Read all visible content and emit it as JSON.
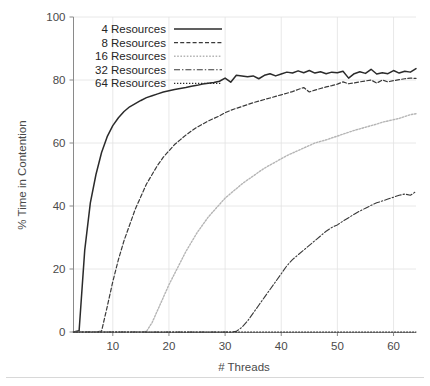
{
  "chart_data": {
    "type": "line",
    "title": "",
    "xlabel": "# Threads",
    "ylabel": "% Time in Contention",
    "xlim": [
      3,
      64
    ],
    "ylim": [
      0,
      100
    ],
    "xticks": [
      10,
      20,
      30,
      40,
      50,
      60
    ],
    "yticks": [
      0,
      20,
      40,
      60,
      80,
      100
    ],
    "xtick_labels": [
      "10",
      "20",
      "30",
      "40",
      "50",
      "60"
    ],
    "ytick_labels": [
      "0",
      "20",
      "40",
      "60",
      "80",
      "100"
    ],
    "grid": true,
    "legend_position": "upper left",
    "x": [
      3,
      4,
      5,
      6,
      7,
      8,
      9,
      10,
      11,
      12,
      13,
      14,
      15,
      16,
      17,
      18,
      19,
      20,
      21,
      22,
      23,
      24,
      25,
      26,
      27,
      28,
      29,
      30,
      31,
      32,
      33,
      34,
      35,
      36,
      37,
      38,
      39,
      40,
      41,
      42,
      43,
      44,
      45,
      46,
      47,
      48,
      49,
      50,
      51,
      52,
      53,
      54,
      55,
      56,
      57,
      58,
      59,
      60,
      61,
      62,
      63,
      64
    ],
    "series": [
      {
        "name": "4 Resources",
        "label": "4 Resources",
        "linestyle": "solid",
        "color": "#2b2b2b",
        "dasharray": "",
        "width": 1.5,
        "values": [
          0,
          0.4,
          26,
          41,
          50,
          57,
          62,
          65.5,
          68,
          70,
          71.5,
          72.5,
          73.5,
          74.4,
          75,
          75.6,
          76.2,
          76.6,
          77,
          77.3,
          77.6,
          78,
          78.3,
          78.7,
          79,
          79.2,
          79.6,
          80.6,
          79.3,
          81.5,
          81.3,
          81,
          81.3,
          80.4,
          81.5,
          82,
          81.3,
          81.9,
          82.5,
          82.2,
          82.9,
          82.3,
          83,
          82.2,
          82.6,
          82,
          82.5,
          82.3,
          82.8,
          80.6,
          82,
          82.6,
          82.1,
          83.4,
          81.9,
          82.3,
          82,
          83,
          82.2,
          82.8,
          82.5,
          83.6
        ]
      },
      {
        "name": "8 Resources",
        "label": "8 Resources",
        "linestyle": "dashed",
        "color": "#3a3a3a",
        "dasharray": "4,2.2",
        "width": 1.2,
        "values": [
          0,
          0,
          0,
          0,
          0,
          0.3,
          8,
          16,
          23,
          29,
          34,
          39,
          43,
          47,
          50,
          53,
          55.5,
          57.5,
          59.5,
          61,
          62.5,
          63.8,
          65,
          66,
          67,
          67.8,
          68.6,
          69.6,
          70.4,
          71,
          71.6,
          72.2,
          72.8,
          73.3,
          73.8,
          74.3,
          74.8,
          75.3,
          75.8,
          76.3,
          77,
          77.6,
          76.2,
          76.8,
          77.3,
          77.8,
          78.2,
          78.7,
          79.4,
          78.8,
          79.1,
          79.4,
          79.7,
          80,
          79,
          80,
          79.4,
          79.8,
          80.1,
          80.4,
          80.6,
          80.5
        ]
      },
      {
        "name": "16 Resources",
        "label": "16 Resources",
        "linestyle": "dotted",
        "color": "#b5b5b5",
        "dasharray": "1.6,1.6",
        "width": 1.4,
        "values": [
          0,
          0,
          0,
          0,
          0,
          0,
          0,
          0,
          0,
          0,
          0,
          0,
          0,
          0.2,
          3,
          7,
          11,
          15,
          18.5,
          22,
          25.5,
          28.5,
          31.5,
          34,
          36.5,
          38.5,
          40.5,
          42.5,
          44,
          45.5,
          47,
          48.3,
          49.5,
          50.8,
          52,
          53,
          54,
          55,
          56,
          56.8,
          57.6,
          58.4,
          59.2,
          60,
          60.5,
          61,
          61.6,
          62.2,
          62.8,
          63.4,
          64,
          64.5,
          65,
          65.5,
          66,
          66.6,
          67,
          67.4,
          67.8,
          68.4,
          69,
          69.3
        ]
      },
      {
        "name": "32 Resources",
        "label": "32 Resources",
        "linestyle": "dashdot",
        "color": "#3a3a3a",
        "dasharray": "6,2,1.4,2",
        "width": 1.1,
        "values": [
          0,
          0,
          0,
          0,
          0,
          0,
          0,
          0,
          0,
          0,
          0,
          0,
          0,
          0,
          0,
          0,
          0,
          0,
          0,
          0,
          0,
          0,
          0,
          0,
          0,
          0,
          0,
          0,
          0,
          0.2,
          1.5,
          3.5,
          6,
          8.5,
          11,
          13.5,
          16,
          18.5,
          21,
          23,
          24.5,
          26,
          27.5,
          29,
          30.5,
          32,
          33.2,
          34,
          35.2,
          36.3,
          37.4,
          38.4,
          39.3,
          40.2,
          41,
          41.6,
          42.2,
          42.8,
          43.4,
          43.8,
          43.4,
          44.6
        ]
      },
      {
        "name": "64 Resources",
        "label": "64 Resources",
        "linestyle": "dotted",
        "color": "#2b2b2b",
        "dasharray": "1.3,1.7",
        "width": 1.1,
        "values": [
          0,
          0,
          0,
          0,
          0,
          0,
          0,
          0,
          0,
          0,
          0,
          0,
          0,
          0,
          0,
          0,
          0,
          0,
          0,
          0,
          0,
          0,
          0,
          0,
          0,
          0,
          0,
          0,
          0,
          0,
          0,
          0,
          0,
          0,
          0,
          0,
          0,
          0,
          0,
          0,
          0,
          0,
          0,
          0,
          0,
          0,
          0,
          0,
          0,
          0,
          0,
          0,
          0,
          0,
          0,
          0,
          0,
          0,
          0,
          0,
          0,
          0
        ]
      }
    ]
  },
  "legend": {
    "items": [
      {
        "label": "4 Resources"
      },
      {
        "label": "8 Resources"
      },
      {
        "label": "16 Resources"
      },
      {
        "label": "32 Resources"
      },
      {
        "label": "64 Resources"
      }
    ]
  },
  "axes": {
    "x_title": "# Threads",
    "y_title": "% Time in Contention"
  }
}
